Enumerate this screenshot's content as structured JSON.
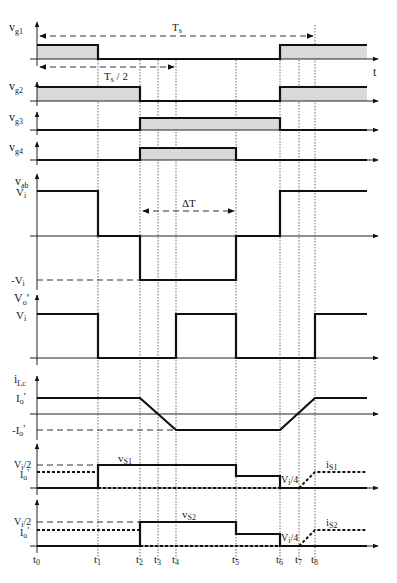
{
  "diagram": {
    "type": "timing-diagram",
    "time_axis_label": "t",
    "period_label": "T",
    "period_sub": "s",
    "half_period_label": "T",
    "half_period_sub": "s",
    "half_period_suffix": " / 2",
    "delta_t_label": "ΔT",
    "time_markers": [
      {
        "name": "t",
        "sub": "0",
        "x": 37
      },
      {
        "name": "t",
        "sub": "1",
        "x": 98
      },
      {
        "name": "t",
        "sub": "2",
        "x": 140
      },
      {
        "name": "t",
        "sub": "3",
        "x": 158
      },
      {
        "name": "t",
        "sub": "4",
        "x": 176
      },
      {
        "name": "t",
        "sub": "5",
        "x": 236
      },
      {
        "name": "t",
        "sub": "6",
        "x": 280
      },
      {
        "name": "t",
        "sub": "7",
        "x": 299
      },
      {
        "name": "t",
        "sub": "8",
        "x": 315
      }
    ],
    "signals": [
      {
        "name": "v",
        "sub": "g1",
        "levels": []
      },
      {
        "name": "v",
        "sub": "g2",
        "levels": []
      },
      {
        "name": "v",
        "sub": "g3",
        "levels": []
      },
      {
        "name": "v",
        "sub": "g4",
        "levels": []
      },
      {
        "name": "v",
        "sub": "ab",
        "levels": [
          "V",
          "-V"
        ],
        "level_subs": [
          "i",
          "i"
        ]
      },
      {
        "name": "V",
        "sub": "o",
        "suffix": "'",
        "levels": [
          "V"
        ],
        "level_subs": [
          "i"
        ]
      },
      {
        "name": "i",
        "sub": "Lc",
        "levels": [
          "I",
          "-I"
        ],
        "level_subs": [
          "o",
          "o"
        ],
        "level_suffix": "'"
      },
      {
        "name": "v",
        "sub": "S1",
        "levels": [
          "V",
          "I"
        ],
        "level_subs": [
          "i",
          "o"
        ],
        "level_texts": [
          "/2",
          "'"
        ],
        "inline_labels": [
          "v",
          "V",
          "i"
        ],
        "inline_subs": [
          "S1",
          "i",
          "S1"
        ],
        "inline_suffix": [
          "",
          "/4",
          ""
        ]
      },
      {
        "name": "v",
        "sub": "S2",
        "levels": [
          "V",
          "I"
        ],
        "level_subs": [
          "i",
          "o"
        ],
        "level_texts": [
          "/2",
          "'"
        ],
        "inline_labels": [
          "v",
          "V",
          "i"
        ],
        "inline_subs": [
          "S2",
          "i",
          "S2"
        ],
        "inline_suffix": [
          "",
          "/4",
          ""
        ]
      }
    ]
  }
}
